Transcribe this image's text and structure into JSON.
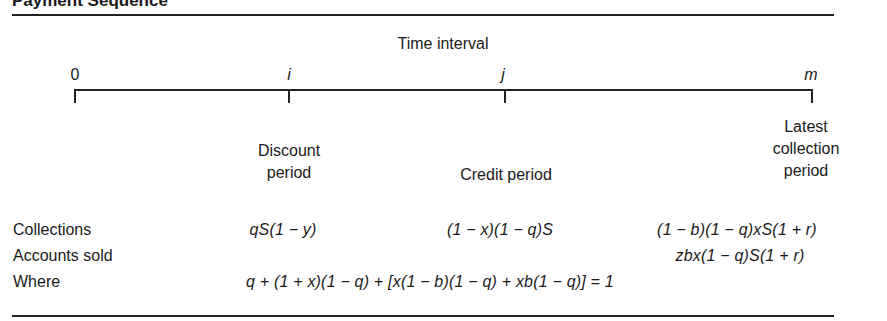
{
  "title": "Payment Sequence",
  "timeline": {
    "header": "Time interval",
    "points": [
      {
        "label": "0",
        "italic": false
      },
      {
        "label": "i",
        "italic": true
      },
      {
        "label": "j",
        "italic": true
      },
      {
        "label": "m",
        "italic": true
      }
    ]
  },
  "periods": {
    "discount": [
      "Discount",
      "period"
    ],
    "credit": "Credit period",
    "latest": [
      "Latest",
      "collection",
      "period"
    ]
  },
  "rows": {
    "collections": {
      "label": "Collections",
      "discount": "qS(1 − y)",
      "credit": "(1 − x)(1 − q)S",
      "latest": "(1 − b)(1 − q)xS(1 + r)"
    },
    "accounts_sold": {
      "label": "Accounts sold",
      "latest": "zbx(1 − q)S(1 + r)"
    },
    "where": {
      "label": "Where",
      "equation": "q + (1 + x)(1 − q) + [x(1 − b)(1 − q) + xb(1 − q)] = 1"
    }
  }
}
